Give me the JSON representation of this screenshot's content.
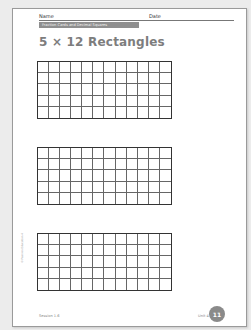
{
  "header": {
    "name_label": "Name",
    "date_label": "Date",
    "banner": "Fraction Cards and Decimal Squares"
  },
  "title": "5 × 12 Rectangles",
  "grids": [
    {
      "rows": 5,
      "cols": 12
    },
    {
      "rows": 5,
      "cols": 12
    },
    {
      "rows": 5,
      "cols": 12
    }
  ],
  "copyright": "© Pearson Education 4",
  "footer": {
    "session": "Session 1.6",
    "unit": "Unit 4",
    "page_number": "11"
  },
  "colors": {
    "banner": "#8f8f8f",
    "title": "#7d7d7d",
    "badge": "#8a8a8a"
  }
}
